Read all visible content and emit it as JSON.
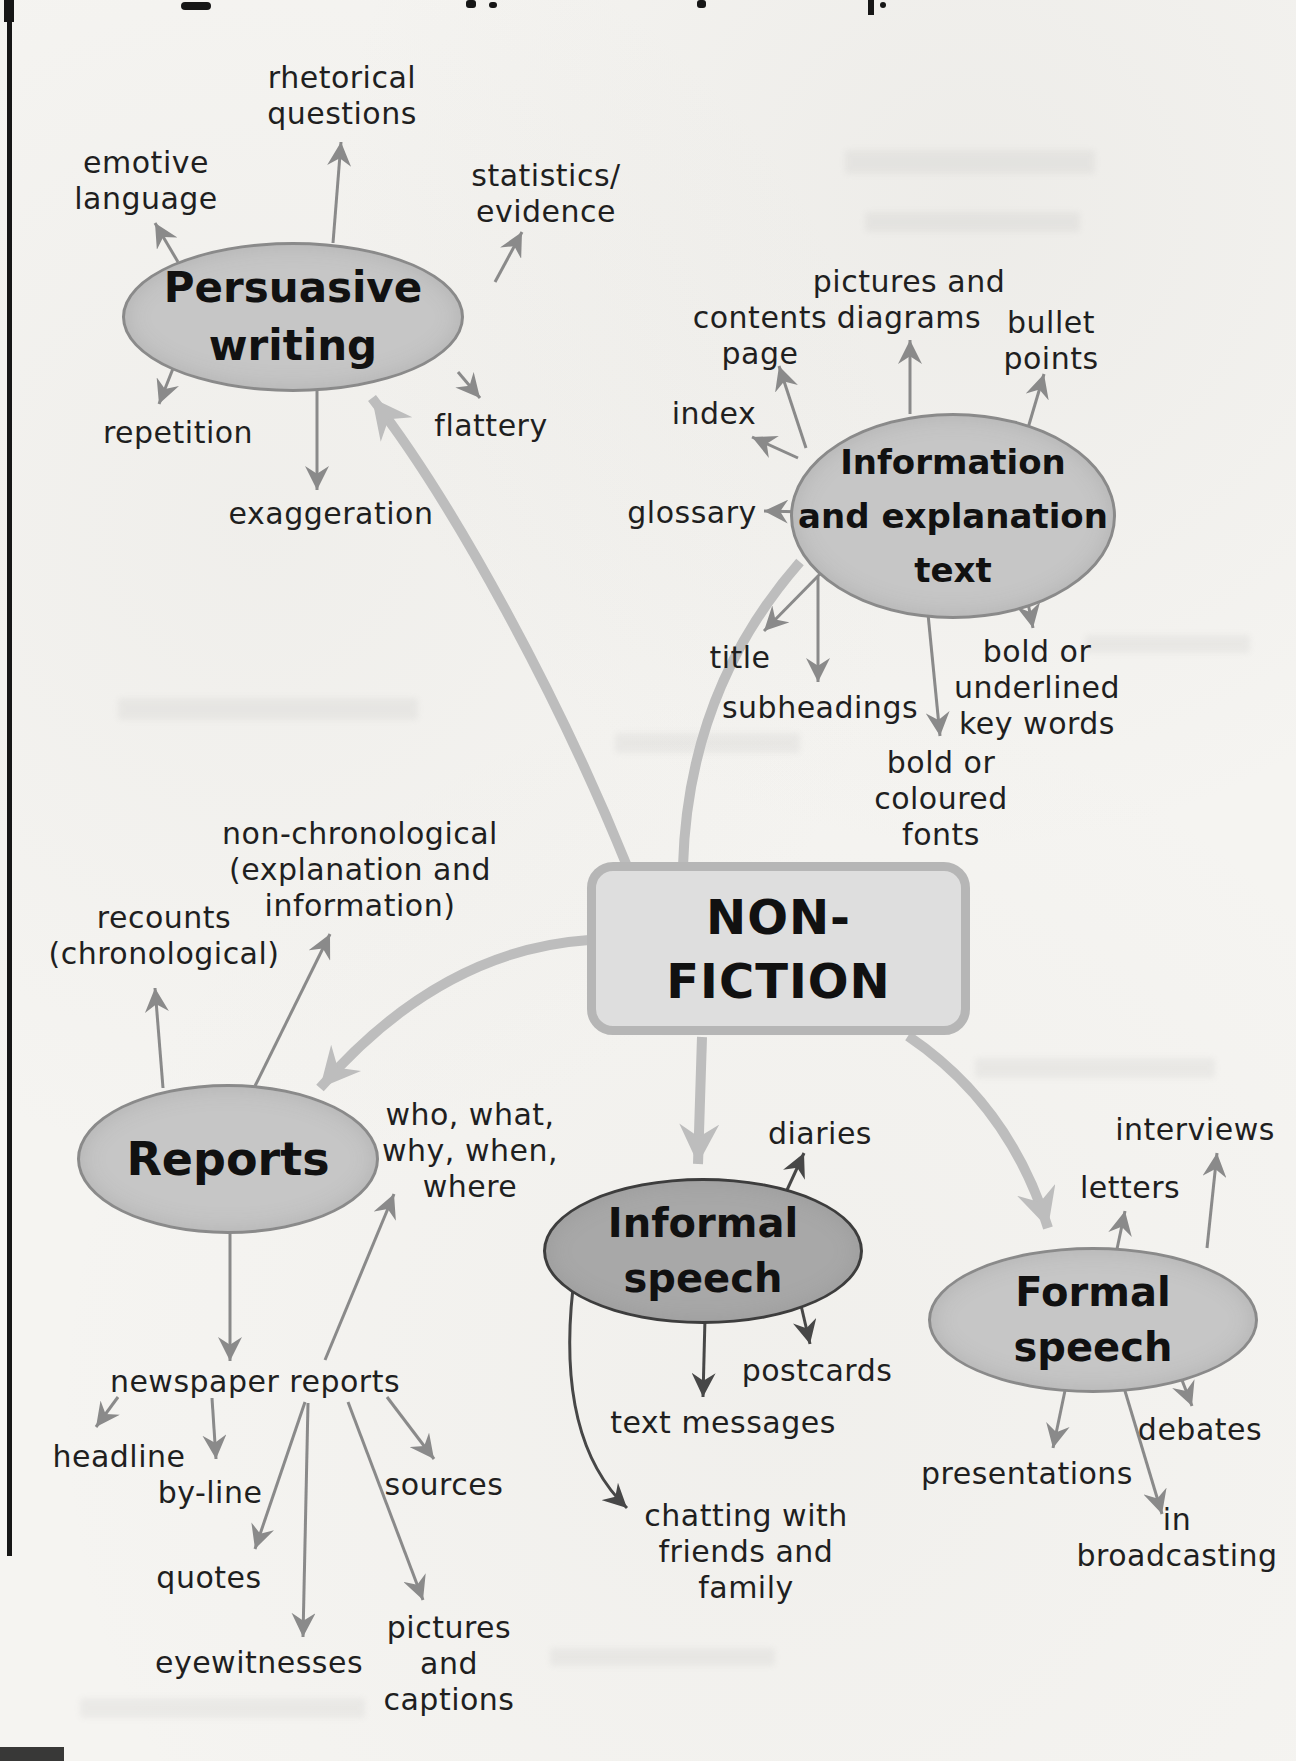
{
  "title_node": {
    "label": "NON-\nFICTION"
  },
  "branches": {
    "persuasive_writing": {
      "label": "Persuasive\nwriting",
      "satellites": {
        "rhetorical_questions": "rhetorical\nquestions",
        "emotive_language": "emotive\nlanguage",
        "statistics_evidence": "statistics/\nevidence",
        "repetition": "repetition",
        "flattery": "flattery",
        "exaggeration": "exaggeration"
      }
    },
    "information_text": {
      "label": "Information\nand explanation\ntext",
      "satellites": {
        "contents_page": "contents\npage",
        "pictures_and_diagrams": "pictures and\ndiagrams",
        "bullet_points": "bullet\npoints",
        "index": "index",
        "glossary": "glossary",
        "title": "title",
        "subheadings": "subheadings",
        "bold_or_coloured_fonts": "bold or\ncoloured\nfonts",
        "bold_or_underlined_key_words": "bold or\nunderlined\nkey words"
      }
    },
    "reports": {
      "label": "Reports",
      "satellites": {
        "recounts_chronological": "recounts\n(chronological)",
        "non_chronological": "non-chronological\n(explanation and\ninformation)",
        "five_ws": "who, what,\nwhy, when,\nwhere",
        "newspaper_reports": "newspaper reports",
        "headline": "headline",
        "by_line": "by-line",
        "quotes": "quotes",
        "eyewitnesses": "eyewitnesses",
        "sources": "sources",
        "pictures_and_captions": "pictures\nand\ncaptions"
      }
    },
    "informal_speech": {
      "label": "Informal\nspeech",
      "satellites": {
        "diaries": "diaries",
        "postcards": "postcards",
        "text_messages": "text messages",
        "chatting": "chatting with\nfriends and\nfamily"
      }
    },
    "formal_speech": {
      "label": "Formal\nspeech",
      "satellites": {
        "interviews": "interviews",
        "letters": "letters",
        "debates": "debates",
        "presentations": "presentations",
        "in_broadcasting": "in broadcasting"
      }
    }
  },
  "colors": {
    "paper": "#f5f4f1",
    "node_fill": "#c6c6c6",
    "node_fill_dark": "#a8a8a8",
    "node_border": "#8a8a8a",
    "box_fill": "#dedede",
    "box_border": "#b6b6b6",
    "thick_connector": "#bdbdbd",
    "thin_arrow": "#8a8a8a",
    "dark_arrow": "#474747",
    "text": "#1f1f1f"
  }
}
